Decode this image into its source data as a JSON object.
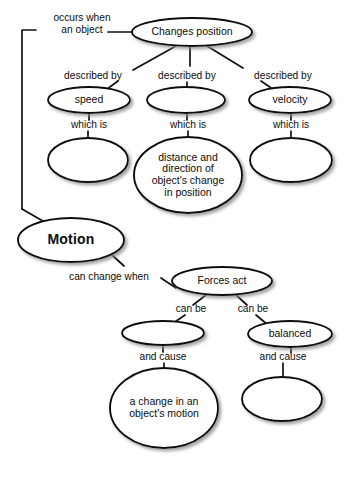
{
  "diagram": {
    "background_color": "#ffffff",
    "stroke_color": "#101010",
    "text_color": "#0d0d0d",
    "nodes": [
      {
        "id": "changes_position",
        "label": "Changes position",
        "cx": 192,
        "cy": 32,
        "rx": 60,
        "ry": 14,
        "bold": false,
        "empty": false
      },
      {
        "id": "speed",
        "label": "speed",
        "cx": 89,
        "cy": 100,
        "rx": 41,
        "ry": 13,
        "bold": false,
        "empty": false
      },
      {
        "id": "blank_middle_top",
        "label": "",
        "cx": 186,
        "cy": 100,
        "rx": 39,
        "ry": 13,
        "bold": false,
        "empty": true
      },
      {
        "id": "velocity",
        "label": "velocity",
        "cx": 290,
        "cy": 100,
        "rx": 41,
        "ry": 13,
        "bold": false,
        "empty": false
      },
      {
        "id": "blank_speed_def",
        "label": "",
        "cx": 88,
        "cy": 160,
        "rx": 40,
        "ry": 22,
        "bold": false,
        "empty": true
      },
      {
        "id": "distance_direction",
        "label": "distance and\ndirection of\nobject's change\nin position",
        "cx": 188,
        "cy": 175,
        "rx": 54,
        "ry": 38,
        "bold": false,
        "empty": false
      },
      {
        "id": "blank_velocity_def",
        "label": "",
        "cx": 291,
        "cy": 160,
        "rx": 41,
        "ry": 22,
        "bold": false,
        "empty": true
      },
      {
        "id": "motion",
        "label": "Motion",
        "cx": 71,
        "cy": 240,
        "rx": 53,
        "ry": 22,
        "bold": true,
        "empty": false
      },
      {
        "id": "forces_act",
        "label": "Forces act",
        "cx": 222,
        "cy": 281,
        "rx": 50,
        "ry": 14,
        "bold": false,
        "empty": false
      },
      {
        "id": "blank_unbalanced",
        "label": "",
        "cx": 163,
        "cy": 333,
        "rx": 41,
        "ry": 12,
        "bold": false,
        "empty": true
      },
      {
        "id": "balanced",
        "label": "balanced",
        "cx": 290,
        "cy": 334,
        "rx": 42,
        "ry": 13,
        "bold": false,
        "empty": false
      },
      {
        "id": "change_in_motion",
        "label": "a change in an\nobject's motion",
        "cx": 164,
        "cy": 408,
        "rx": 54,
        "ry": 40,
        "bold": false,
        "empty": false
      },
      {
        "id": "blank_balanced_effect",
        "label": "",
        "cx": 282,
        "cy": 399,
        "rx": 40,
        "ry": 22,
        "bold": false,
        "empty": true
      }
    ],
    "link_labels": [
      {
        "id": "occurs_when_an_object",
        "text": "occurs when\nan object",
        "x": 34,
        "y": 12,
        "width": 96,
        "align": "center"
      },
      {
        "id": "described_by_left",
        "text": "described by",
        "x": 58,
        "y": 70,
        "width": 70,
        "align": "center"
      },
      {
        "id": "described_by_middle",
        "text": "described by",
        "x": 152,
        "y": 70,
        "width": 70,
        "align": "center"
      },
      {
        "id": "described_by_right",
        "text": "described by",
        "x": 246,
        "y": 70,
        "width": 74,
        "align": "center"
      },
      {
        "id": "which_is_left",
        "text": "which is",
        "x": 62,
        "y": 119,
        "width": 54,
        "align": "center"
      },
      {
        "id": "which_is_middle",
        "text": "which is",
        "x": 161,
        "y": 119,
        "width": 54,
        "align": "center"
      },
      {
        "id": "which_is_right",
        "text": "which is",
        "x": 264,
        "y": 119,
        "width": 54,
        "align": "center"
      },
      {
        "id": "can_change_when",
        "text": "can change when",
        "x": 58,
        "y": 271,
        "width": 102,
        "align": "center"
      },
      {
        "id": "can_be_left",
        "text": "can be",
        "x": 168,
        "y": 303,
        "width": 46,
        "align": "center"
      },
      {
        "id": "can_be_right",
        "text": "can be",
        "x": 230,
        "y": 303,
        "width": 46,
        "align": "center"
      },
      {
        "id": "and_cause_left",
        "text": "and cause",
        "x": 131,
        "y": 351,
        "width": 64,
        "align": "center"
      },
      {
        "id": "and_cause_right",
        "text": "and cause",
        "x": 251,
        "y": 351,
        "width": 64,
        "align": "center"
      }
    ],
    "connectors": [
      {
        "id": "changes-position-to-occurs-when",
        "path": "M 132 32 L 108 32"
      },
      {
        "id": "occurs-when-bracket-top",
        "path": "M 36 30 L 23 30"
      },
      {
        "id": "occurs-when-bracket-down",
        "path": "M 22 30 L 22 209"
      },
      {
        "id": "occurs-when-to-motion",
        "path": "M 22 209 L 55 228"
      },
      {
        "id": "changes-position-to-described-by-left",
        "path": "M 176 46 L 133 70"
      },
      {
        "id": "changes-position-to-described-by-middle",
        "path": "M 190 46 L 190 66"
      },
      {
        "id": "changes-position-to-described-by-right",
        "path": "M 207 46 L 243 68"
      },
      {
        "id": "described-by-left-to-speed",
        "path": "M 118 81 L 103 92"
      },
      {
        "id": "described-by-middle-to-blank",
        "path": "M 187 82 L 187 88"
      },
      {
        "id": "described-by-right-to-velocity",
        "path": "M 261 81 L 277 92"
      },
      {
        "id": "speed-to-which-is",
        "path": "M 89 113 L 89 120"
      },
      {
        "id": "which-is-left-to-blank",
        "path": "M 88 131 L 88 139"
      },
      {
        "id": "blank-middle-to-which-is",
        "path": "M 187 113 L 187 120"
      },
      {
        "id": "which-is-middle-to-distance",
        "path": "M 188 131 L 188 139"
      },
      {
        "id": "velocity-to-which-is",
        "path": "M 291 113 L 291 120"
      },
      {
        "id": "which-is-right-to-blank",
        "path": "M 291 131 L 291 139"
      },
      {
        "id": "motion-to-can-change-when",
        "path": "M 112 255 L 124 266"
      },
      {
        "id": "can-change-when-to-forces-act",
        "path": "M 161 278 L 176 288"
      },
      {
        "id": "forces-act-to-can-be-left",
        "path": "M 206 295 L 193 305"
      },
      {
        "id": "forces-act-to-can-be-right",
        "path": "M 236 295 L 247 305"
      },
      {
        "id": "can-be-left-to-blank",
        "path": "M 185 315 L 172 324"
      },
      {
        "id": "can-be-right-to-balanced",
        "path": "M 256 315 L 268 325"
      },
      {
        "id": "blank-unbalanced-to-and-cause",
        "path": "M 163 345 L 163 352"
      },
      {
        "id": "and-cause-left-to-change-in-motion",
        "path": "M 164 363 L 164 370"
      },
      {
        "id": "balanced-to-and-cause",
        "path": "M 291 347 L 291 353"
      },
      {
        "id": "and-cause-right-to-blank",
        "path": "M 283 363 L 283 378"
      }
    ]
  }
}
